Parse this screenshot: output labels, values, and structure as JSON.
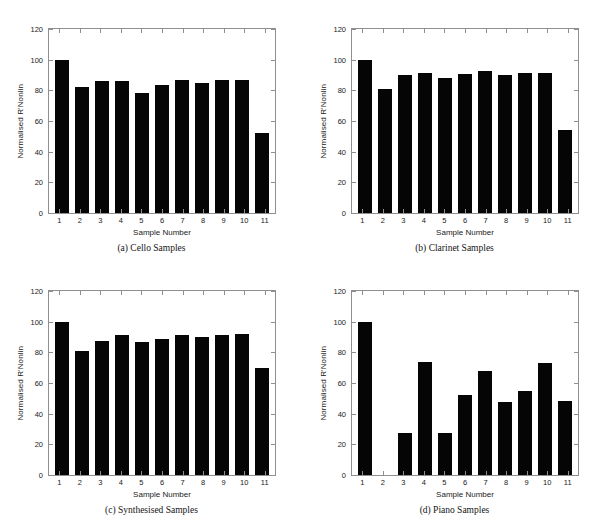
{
  "figure": {
    "background": "#ffffff",
    "bar_color": "#050505",
    "axis_color": "#8f8f8f"
  },
  "chart_data": [
    {
      "type": "bar",
      "panel": "a",
      "title": "(a) Cello Samples",
      "xlabel": "Sample Number",
      "ylabel": "Normalised R'Nonlin",
      "categories": [
        "1",
        "2",
        "3",
        "4",
        "5",
        "6",
        "7",
        "8",
        "9",
        "10",
        "11"
      ],
      "values": [
        100,
        82,
        86,
        86,
        78.5,
        83.5,
        86.5,
        85,
        86.5,
        86.5,
        52
      ],
      "ylim": [
        0,
        120
      ],
      "yticks": [
        0,
        20,
        40,
        60,
        80,
        100,
        120
      ],
      "grid": false,
      "legend": "none"
    },
    {
      "type": "bar",
      "panel": "b",
      "title": "(b) Clarinet Samples",
      "xlabel": "Sample Number",
      "ylabel": "Normalised R'Nonlin",
      "categories": [
        "1",
        "2",
        "3",
        "4",
        "5",
        "6",
        "7",
        "8",
        "9",
        "10",
        "11"
      ],
      "values": [
        100,
        81,
        90,
        91,
        88,
        90.5,
        92.5,
        90,
        91,
        91.5,
        54
      ],
      "ylim": [
        0,
        120
      ],
      "yticks": [
        0,
        20,
        40,
        60,
        80,
        100,
        120
      ],
      "grid": false,
      "legend": "none"
    },
    {
      "type": "bar",
      "panel": "c",
      "title": "(c) Synthesised Samples",
      "xlabel": "Sample Number",
      "ylabel": "Normalised R'Nonlin",
      "categories": [
        "1",
        "2",
        "3",
        "4",
        "5",
        "6",
        "7",
        "8",
        "9",
        "10",
        "11"
      ],
      "values": [
        100,
        81,
        87.5,
        91.5,
        87,
        89,
        91.5,
        90,
        91,
        92,
        69.5
      ],
      "ylim": [
        0,
        120
      ],
      "yticks": [
        0,
        20,
        40,
        60,
        80,
        100,
        120
      ],
      "grid": false,
      "legend": "none"
    },
    {
      "type": "bar",
      "panel": "d",
      "title": "(d) Piano Samples",
      "xlabel": "Sample Number",
      "ylabel": "Normalised R'Nonlin",
      "categories": [
        "1",
        "2",
        "3",
        "4",
        "5",
        "6",
        "7",
        "8",
        "9",
        "10",
        "11"
      ],
      "values": [
        100,
        0,
        27.5,
        74,
        27.5,
        52.5,
        68,
        47.5,
        55,
        73,
        48
      ],
      "ylim": [
        0,
        120
      ],
      "yticks": [
        0,
        20,
        40,
        60,
        80,
        100,
        120
      ],
      "grid": false,
      "legend": "none"
    }
  ]
}
